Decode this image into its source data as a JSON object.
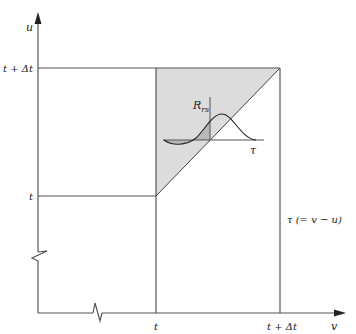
{
  "diagram": {
    "type": "integration-domain",
    "colors": {
      "line": "#555555",
      "shade": "#dcdcdc",
      "inset_shade": "#b8b8b8",
      "background": "#ffffff"
    },
    "axes": {
      "vertical_label": "u",
      "horizontal_label": "v"
    },
    "u_ticks": [
      {
        "label": "t + Δt"
      },
      {
        "label": "t"
      }
    ],
    "v_ticks": [
      {
        "label": "t"
      },
      {
        "label": "t + Δt"
      }
    ],
    "diagonal_label": "τ (= v − u)",
    "inset": {
      "y_label": "R",
      "y_label_sub": "rs",
      "x_label": "τ"
    }
  }
}
